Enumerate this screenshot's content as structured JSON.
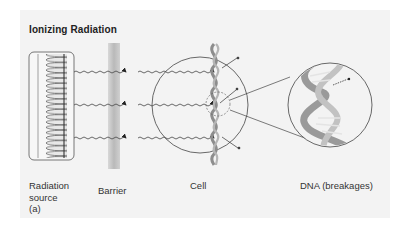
{
  "figure": {
    "title": "Ionizing Radiation",
    "panel_label": "(a)",
    "colors": {
      "panel_bg": "#f3f3f3",
      "line": "#444444",
      "barrier": "#c8c8c8",
      "dna": "#a9a9a9"
    }
  },
  "components": [
    {
      "id": "source",
      "label_line1": "Radiation",
      "label_line2": "source"
    },
    {
      "id": "barrier",
      "label": "Barrier"
    },
    {
      "id": "cell",
      "label": "Cell"
    },
    {
      "id": "dna",
      "label": "DNA (breakages)"
    }
  ],
  "radiation_rays": 3
}
